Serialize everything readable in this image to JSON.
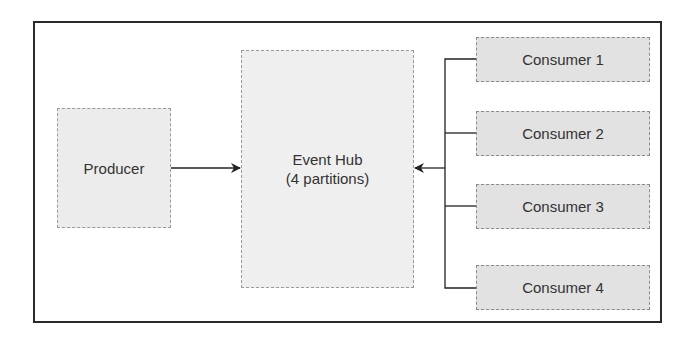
{
  "diagram": {
    "producer": {
      "label": "Producer"
    },
    "event_hub": {
      "line1": "Event Hub",
      "line2": "(4 partitions)"
    },
    "consumers": [
      {
        "label": "Consumer 1"
      },
      {
        "label": "Consumer 2"
      },
      {
        "label": "Consumer 3"
      },
      {
        "label": "Consumer 4"
      }
    ],
    "edges": [
      {
        "from": "Producer",
        "to": "Event Hub"
      },
      {
        "from": "Consumer 1",
        "to": "Event Hub"
      },
      {
        "from": "Consumer 2",
        "to": "Event Hub"
      },
      {
        "from": "Consumer 3",
        "to": "Event Hub"
      },
      {
        "from": "Consumer 4",
        "to": "Event Hub"
      }
    ],
    "colors": {
      "frame": "#2a2a2a",
      "node_fill": "#ececec",
      "consumer_fill": "#e2e2e2",
      "text": "#333333"
    }
  }
}
